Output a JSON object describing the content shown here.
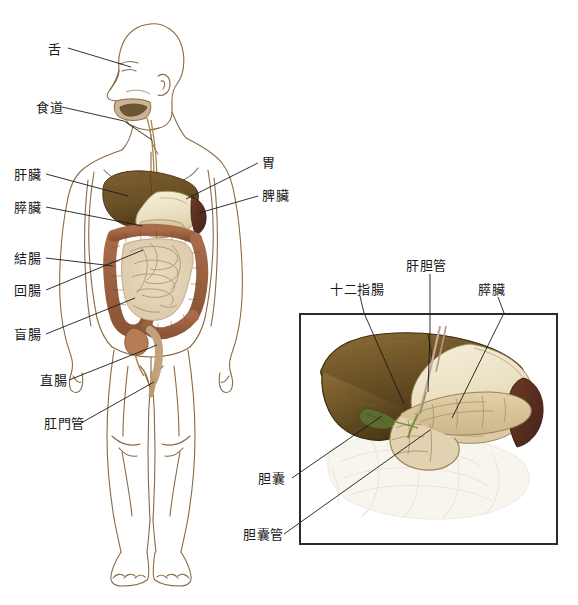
{
  "figure": {
    "body_labels": [
      {
        "id": "tongue",
        "text": "舌",
        "x": 48,
        "y": 50,
        "align": "left"
      },
      {
        "id": "esophagus",
        "text": "食道",
        "x": 36,
        "y": 108,
        "align": "left"
      },
      {
        "id": "liver",
        "text": "肝臟",
        "x": 14,
        "y": 175,
        "align": "left"
      },
      {
        "id": "pancreas",
        "text": "膵臟",
        "x": 14,
        "y": 208,
        "align": "left"
      },
      {
        "id": "colon",
        "text": "結腸",
        "x": 14,
        "y": 259,
        "align": "left"
      },
      {
        "id": "ileum",
        "text": "回腸",
        "x": 14,
        "y": 291,
        "align": "left"
      },
      {
        "id": "cecum",
        "text": "盲腸",
        "x": 14,
        "y": 335,
        "align": "left"
      },
      {
        "id": "rectum",
        "text": "直腸",
        "x": 40,
        "y": 381,
        "align": "left"
      },
      {
        "id": "anal-canal",
        "text": "肛門管",
        "x": 44,
        "y": 424,
        "align": "left"
      },
      {
        "id": "stomach",
        "text": "胃",
        "x": 262,
        "y": 163,
        "align": "left"
      },
      {
        "id": "spleen",
        "text": "脾臟",
        "x": 262,
        "y": 196,
        "align": "left"
      }
    ],
    "inset_labels": [
      {
        "id": "duodenum",
        "text": "十二指腸",
        "x": 330,
        "y": 290,
        "align": "left"
      },
      {
        "id": "bile-duct",
        "text": "肝胆管",
        "x": 406,
        "y": 266,
        "align": "left"
      },
      {
        "id": "pancreas",
        "text": "膵臟",
        "x": 478,
        "y": 290,
        "align": "left"
      },
      {
        "id": "gallbladder",
        "text": "胆囊",
        "x": 258,
        "y": 479,
        "align": "left"
      },
      {
        "id": "cystic-duct",
        "text": "胆囊管",
        "x": 243,
        "y": 535,
        "align": "left"
      }
    ]
  },
  "colors": {
    "outline": "#8a6a45",
    "liver": "#6b5126",
    "liver_dark": "#4d3a19",
    "stomach": "#efe2c4",
    "pancreas": "#d8c49a",
    "spleen": "#5e3222",
    "colon": "#9c6243",
    "small_intestine": "#e0cfb4",
    "gallbladder": "#5d6b2e",
    "leader": "#1a1a1a",
    "frame": "#2b2b2b",
    "background": "#ffffff"
  }
}
